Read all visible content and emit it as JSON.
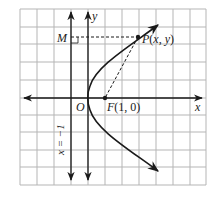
{
  "diagram": {
    "labels": {
      "x_axis": "x",
      "y_axis": "y",
      "origin": "O",
      "focus": "F(1, 0)",
      "point": "P(x, y)",
      "foot": "M",
      "directrix": "x = −1"
    },
    "grid": {
      "columns": 11,
      "rows": 10,
      "unit_cells": 1
    },
    "focus": {
      "x": 1,
      "y": 0
    },
    "directrix": {
      "x": -1
    },
    "curve": "y^2 = 4x",
    "colors": {
      "grid": "#b5b5b5",
      "ink": "#1a1a1a",
      "background": "#ffffff"
    }
  }
}
